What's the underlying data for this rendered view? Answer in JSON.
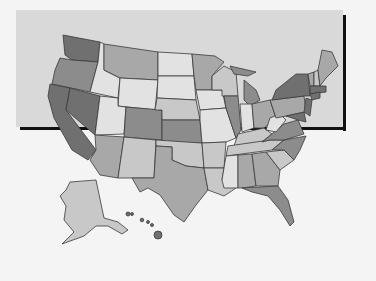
{
  "map": {
    "type": "choropleth",
    "region": "United States",
    "legend": null,
    "title": null,
    "shades": {
      "very_light": "#e2e2e2",
      "light": "#c8c8c8",
      "medium": "#a8a8a8",
      "medium_dark": "#8c8c8c",
      "dark": "#707070"
    },
    "states": [
      {
        "name": "WA",
        "shade": "dark"
      },
      {
        "name": "OR",
        "shade": "medium_dark"
      },
      {
        "name": "CA",
        "shade": "dark"
      },
      {
        "name": "NV",
        "shade": "dark"
      },
      {
        "name": "ID",
        "shade": "very_light"
      },
      {
        "name": "MT",
        "shade": "medium"
      },
      {
        "name": "WY",
        "shade": "very_light"
      },
      {
        "name": "UT",
        "shade": "very_light"
      },
      {
        "name": "CO",
        "shade": "medium_dark"
      },
      {
        "name": "AZ",
        "shade": "medium"
      },
      {
        "name": "NM",
        "shade": "light"
      },
      {
        "name": "ND",
        "shade": "very_light"
      },
      {
        "name": "SD",
        "shade": "very_light"
      },
      {
        "name": "NE",
        "shade": "light"
      },
      {
        "name": "KS",
        "shade": "medium_dark"
      },
      {
        "name": "OK",
        "shade": "light"
      },
      {
        "name": "TX",
        "shade": "medium"
      },
      {
        "name": "MN",
        "shade": "medium"
      },
      {
        "name": "IA",
        "shade": "very_light"
      },
      {
        "name": "MO",
        "shade": "very_light"
      },
      {
        "name": "AR",
        "shade": "light"
      },
      {
        "name": "LA",
        "shade": "light"
      },
      {
        "name": "WI",
        "shade": "light"
      },
      {
        "name": "IL",
        "shade": "medium_dark"
      },
      {
        "name": "MI",
        "shade": "medium_dark"
      },
      {
        "name": "IN",
        "shade": "very_light"
      },
      {
        "name": "OH",
        "shade": "medium"
      },
      {
        "name": "KY",
        "shade": "light"
      },
      {
        "name": "TN",
        "shade": "light"
      },
      {
        "name": "MS",
        "shade": "very_light"
      },
      {
        "name": "AL",
        "shade": "medium"
      },
      {
        "name": "GA",
        "shade": "medium"
      },
      {
        "name": "FL",
        "shade": "medium_dark"
      },
      {
        "name": "SC",
        "shade": "light"
      },
      {
        "name": "NC",
        "shade": "medium_dark"
      },
      {
        "name": "VA",
        "shade": "medium_dark"
      },
      {
        "name": "WV",
        "shade": "very_light"
      },
      {
        "name": "PA",
        "shade": "medium"
      },
      {
        "name": "NY",
        "shade": "dark"
      },
      {
        "name": "ME",
        "shade": "medium"
      },
      {
        "name": "NJ",
        "shade": "dark"
      },
      {
        "name": "AK",
        "shade": "light"
      },
      {
        "name": "HI",
        "shade": "dark"
      }
    ]
  }
}
